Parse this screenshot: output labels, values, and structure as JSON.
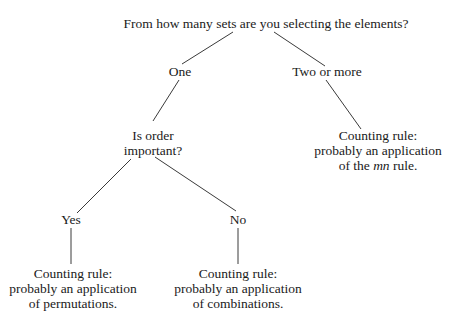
{
  "diagram": {
    "type": "decision-tree",
    "root": {
      "question": "From how many sets are you selecting the elements?"
    },
    "branches": {
      "one": {
        "label": "One"
      },
      "two_or_more": {
        "label": "Two or more"
      }
    },
    "order_question": {
      "line1": "Is order",
      "line2": "important?"
    },
    "order_branches": {
      "yes": {
        "label": "Yes"
      },
      "no": {
        "label": "No"
      }
    },
    "outcomes": {
      "mn": {
        "line1": "Counting rule:",
        "line2": "probably an application",
        "line3_prefix": "of the ",
        "line3_italic": "mn",
        "line3_suffix": " rule."
      },
      "permutations": {
        "line1": "Counting rule:",
        "line2": "probably an application",
        "line3": "of permutations."
      },
      "combinations": {
        "line1": "Counting rule:",
        "line2": "probably an application",
        "line3": "of combinations."
      }
    },
    "edges": [
      {
        "from": "root",
        "to": "One"
      },
      {
        "from": "root",
        "to": "Two or more"
      },
      {
        "from": "One",
        "to": "Is order important?"
      },
      {
        "from": "Two or more",
        "to": "Counting rule: mn rule"
      },
      {
        "from": "Is order important?",
        "to": "Yes"
      },
      {
        "from": "Is order important?",
        "to": "No"
      },
      {
        "from": "Yes",
        "to": "Counting rule: permutations"
      },
      {
        "from": "No",
        "to": "Counting rule: combinations"
      }
    ]
  }
}
